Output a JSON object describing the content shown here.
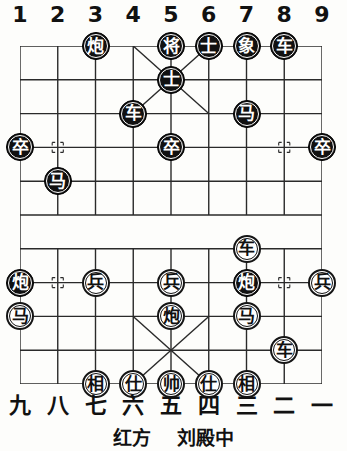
{
  "diagram": {
    "type": "xiangqi-board",
    "files_top": [
      "1",
      "2",
      "3",
      "4",
      "5",
      "6",
      "7",
      "8",
      "9"
    ],
    "files_bottom": [
      "九",
      "八",
      "七",
      "六",
      "五",
      "四",
      "三",
      "二",
      "一"
    ],
    "ranks": 10,
    "columns": 9,
    "river_present": true,
    "board_colors": {
      "line": "#2a2a2a",
      "background": "#fdfdfb",
      "black_piece_fill": "#111111",
      "black_piece_text": "#ffffff",
      "red_piece_fill": "#ffffff",
      "red_piece_text": "#111111"
    }
  },
  "caption": {
    "side_label": "红方",
    "player_name": "刘殿中"
  },
  "pieces": [
    {
      "glyph": "炮",
      "side": "black",
      "file": 3,
      "rank": 1,
      "name": "black-cannon-f3r1"
    },
    {
      "glyph": "将",
      "side": "black",
      "file": 5,
      "rank": 1,
      "name": "black-general-f5r1"
    },
    {
      "glyph": "士",
      "side": "black",
      "file": 6,
      "rank": 1,
      "name": "black-advisor-f6r1"
    },
    {
      "glyph": "象",
      "side": "black",
      "file": 7,
      "rank": 1,
      "name": "black-elephant-f7r1"
    },
    {
      "glyph": "车",
      "side": "black",
      "file": 8,
      "rank": 1,
      "name": "black-chariot-f8r1"
    },
    {
      "glyph": "士",
      "side": "black",
      "file": 5,
      "rank": 2,
      "name": "black-advisor-f5r2"
    },
    {
      "glyph": "车",
      "side": "black",
      "file": 4,
      "rank": 3,
      "name": "black-chariot-f4r3"
    },
    {
      "glyph": "马",
      "side": "black",
      "file": 7,
      "rank": 3,
      "name": "black-horse-f7r3"
    },
    {
      "glyph": "卒",
      "side": "black",
      "file": 1,
      "rank": 4,
      "name": "black-soldier-f1r4"
    },
    {
      "glyph": "卒",
      "side": "black",
      "file": 5,
      "rank": 4,
      "name": "black-soldier-f5r4"
    },
    {
      "glyph": "卒",
      "side": "black",
      "file": 9,
      "rank": 4,
      "name": "black-soldier-f9r4"
    },
    {
      "glyph": "马",
      "side": "black",
      "file": 2,
      "rank": 5,
      "name": "black-horse-f2r5"
    },
    {
      "glyph": "车",
      "side": "red",
      "file": 7,
      "rank": 7,
      "name": "red-chariot-f7r7"
    },
    {
      "glyph": "炮",
      "side": "black",
      "file": 1,
      "rank": 8,
      "name": "black-cannon-f1r8"
    },
    {
      "glyph": "兵",
      "side": "red",
      "file": 3,
      "rank": 8,
      "name": "red-soldier-f3r8"
    },
    {
      "glyph": "兵",
      "side": "red",
      "file": 5,
      "rank": 8,
      "name": "red-soldier-f5r8"
    },
    {
      "glyph": "炮",
      "side": "black",
      "file": 7,
      "rank": 8,
      "name": "black-cannon-f7r8"
    },
    {
      "glyph": "兵",
      "side": "red",
      "file": 9,
      "rank": 8,
      "name": "red-soldier-f9r8"
    },
    {
      "glyph": "马",
      "side": "red",
      "file": 1,
      "rank": 9,
      "name": "red-horse-f1r9"
    },
    {
      "glyph": "炮",
      "side": "red",
      "file": 5,
      "rank": 9,
      "name": "red-cannon-f5r9"
    },
    {
      "glyph": "马",
      "side": "red",
      "file": 7,
      "rank": 9,
      "name": "red-horse-f7r9"
    },
    {
      "glyph": "车",
      "side": "red",
      "file": 8,
      "rank": 10,
      "name": "red-chariot-f8r10"
    },
    {
      "glyph": "相",
      "side": "red",
      "file": 3,
      "rank": 11,
      "name": "red-elephant-f3r11"
    },
    {
      "glyph": "仕",
      "side": "red",
      "file": 4,
      "rank": 11,
      "name": "red-advisor-f4r11"
    },
    {
      "glyph": "帅",
      "side": "red",
      "file": 5,
      "rank": 11,
      "name": "red-marshal-f5r11"
    },
    {
      "glyph": "仕",
      "side": "red",
      "file": 6,
      "rank": 11,
      "name": "red-advisor-f6r11"
    },
    {
      "glyph": "相",
      "side": "red",
      "file": 7,
      "rank": 11,
      "name": "red-elephant-f7r11"
    }
  ]
}
